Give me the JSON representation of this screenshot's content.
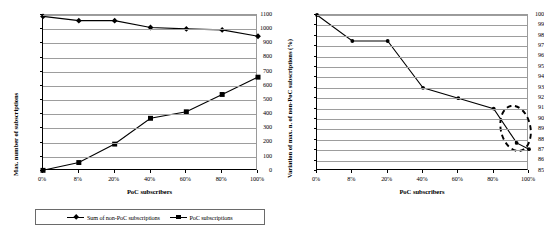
{
  "figure": {
    "background": "#ffffff",
    "series_color": "#000000",
    "grid_color": "#9d9d9d",
    "annotation_color": "#000000"
  },
  "chart_data": [
    {
      "id": "left",
      "type": "line",
      "title": "",
      "xlabel": "PoC subscribers",
      "ylabel": "Max. number of subscriptions",
      "categories": [
        "0%",
        "8%",
        "20%",
        "40%",
        "60%",
        "80%",
        "100%"
      ],
      "ylim": [
        0,
        1100
      ],
      "yticks": [
        0,
        100,
        200,
        300,
        400,
        500,
        600,
        700,
        800,
        900,
        1000,
        1100
      ],
      "grid": true,
      "legend": "bottom",
      "series": [
        {
          "name": "Sum of non-PoC subscriptions",
          "marker": "diamond",
          "values": [
            1090,
            1060,
            1060,
            1012,
            1002,
            995,
            950
          ]
        },
        {
          "name": "PoC subscriptions",
          "marker": "square",
          "values": [
            5,
            60,
            190,
            372,
            418,
            540,
            662
          ]
        }
      ]
    },
    {
      "id": "right",
      "type": "line",
      "title": "",
      "xlabel": "PoC subscribers",
      "ylabel": "Variation of max. n. of non-PoC subscriptions (%)",
      "categories": [
        "0%",
        "8%",
        "20%",
        "40%",
        "60%",
        "80%",
        "100%"
      ],
      "ylim": [
        85,
        100
      ],
      "yticks": [
        85,
        86,
        87,
        88,
        89,
        90,
        91,
        92,
        93,
        94,
        95,
        96,
        97,
        98,
        99,
        100
      ],
      "grid": true,
      "legend": "none",
      "series": [
        {
          "name": "Variation of max. n. of non-PoC subscriptions",
          "marker": "dot",
          "x": [
            0,
            1,
            2,
            3,
            4,
            5,
            5.65,
            6
          ],
          "values": [
            100,
            97.5,
            97.5,
            93.0,
            92.0,
            91.0,
            87.7,
            87.1
          ]
        }
      ],
      "annotations": [
        {
          "kind": "ellipse",
          "style": "dashed",
          "name": "highlight-ellipse",
          "center_x": 5.62,
          "center_y": 89.1,
          "radius_x": 0.42,
          "radius_y": 2.2,
          "rotation_deg": -12
        }
      ]
    }
  ],
  "left_chart": {
    "name": "max-number-of-subscriptions-chart",
    "ylabel": "Max. number of subscriptions",
    "xlabel": "PoC subscribers",
    "ytick_labels": [
      "1100",
      "1000",
      "900",
      "800",
      "700",
      "600",
      "500",
      "400",
      "300",
      "200",
      "100",
      "0"
    ],
    "xtick_labels": [
      "0%",
      "8%",
      "20%",
      "40%",
      "60%",
      "80%",
      "100%"
    ],
    "legend": {
      "items": [
        {
          "label": "Sum of non-PoC subscriptions",
          "marker": "diamond"
        },
        {
          "label": "PoC subscriptions",
          "marker": "square"
        }
      ]
    }
  },
  "right_chart": {
    "name": "variation-of-max-non-poc-subscriptions-chart",
    "ylabel": "Variation of max. n. of non-PoC subscriptions (%)",
    "xlabel": "PoC subscribers",
    "ytick_labels": [
      "100",
      "99",
      "98",
      "97",
      "96",
      "95",
      "94",
      "93",
      "92",
      "91",
      "90",
      "89",
      "88",
      "87",
      "86",
      "85"
    ],
    "xtick_labels": [
      "0%",
      "8%",
      "20%",
      "40%",
      "60%",
      "80%",
      "100%"
    ]
  }
}
